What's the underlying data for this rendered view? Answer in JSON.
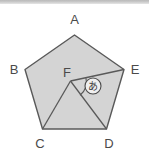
{
  "figure": {
    "shape_type": "regular-pentagon",
    "fill_color": "#d4d4d4",
    "stroke_color": "#595959",
    "label_color": "#4a4a4a",
    "background_color": "#ffffff",
    "top_band_color": "#bdbdbd",
    "vertices": [
      {
        "id": "A",
        "label": "A",
        "x": 74.5,
        "y": 35.0,
        "label_x": 74.5,
        "label_y": 24.0
      },
      {
        "id": "B",
        "label": "B",
        "x": 25.0,
        "y": 69.5,
        "label_x": 14.0,
        "label_y": 70.5
      },
      {
        "id": "C",
        "label": "C",
        "x": 42.5,
        "y": 129.0,
        "label_x": 40.0,
        "label_y": 146.0
      },
      {
        "id": "D",
        "label": "D",
        "x": 106.5,
        "y": 129.0,
        "label_x": 109.0,
        "label_y": 146.0
      },
      {
        "id": "E",
        "label": "E",
        "x": 124.0,
        "y": 69.5,
        "label_x": 135.0,
        "label_y": 70.5
      }
    ],
    "interior_points": [
      {
        "id": "F",
        "label": "F",
        "x": 70.5,
        "y": 81.0,
        "label_x": 67.0,
        "label_y": 73.0
      }
    ],
    "segments": [
      {
        "from": "A",
        "to": "B",
        "kind": "pentagon-side"
      },
      {
        "from": "B",
        "to": "C",
        "kind": "pentagon-side"
      },
      {
        "from": "C",
        "to": "D",
        "kind": "pentagon-side"
      },
      {
        "from": "D",
        "to": "E",
        "kind": "pentagon-side"
      },
      {
        "from": "E",
        "to": "A",
        "kind": "pentagon-side"
      },
      {
        "from": "F",
        "to": "C",
        "kind": "interior-segment"
      },
      {
        "from": "F",
        "to": "D",
        "kind": "interior-segment"
      },
      {
        "from": "F",
        "to": "E",
        "kind": "interior-segment"
      }
    ],
    "angle_marks": [
      {
        "id": "angle-a",
        "glyph": "あ",
        "at_vertex": "F",
        "between": "FD and FE",
        "marker_x": 93.0,
        "marker_y": 86.0,
        "marker_radius": 8.0,
        "arc_radius": 16.0,
        "arc_start_deg": -22,
        "arc_end_deg": 55
      }
    ]
  }
}
